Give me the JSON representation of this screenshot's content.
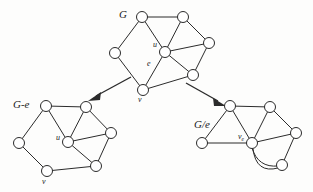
{
  "figure": {
    "background_color": "#fdfdfc",
    "ink_color": "#2b2b2b",
    "node_fill": "#ffffff"
  },
  "labels": {
    "graph_g": "G",
    "graph_g_minus_e": "G-e",
    "graph_g_slash_e": "G/e",
    "vertex_u": "u",
    "edge_e": "e",
    "vertex_v": "v",
    "vertex_u_left": "u",
    "vertex_v_left": "v",
    "vertex_ve_base": "v",
    "vertex_ve_sub": "e"
  },
  "graphs": [
    {
      "name": "G",
      "label": "G",
      "label_pos": [
        119,
        18
      ],
      "nodes": [
        {
          "id": "a",
          "cx": 142,
          "cy": 17,
          "r": 5.5,
          "label": ""
        },
        {
          "id": "b",
          "cx": 183,
          "cy": 17,
          "r": 5.5,
          "label": ""
        },
        {
          "id": "c",
          "cx": 115,
          "cy": 53,
          "r": 5.5,
          "label": ""
        },
        {
          "id": "u",
          "cx": 165,
          "cy": 52,
          "r": 5.5,
          "label": "u"
        },
        {
          "id": "d",
          "cx": 209,
          "cy": 43,
          "r": 5.5,
          "label": ""
        },
        {
          "id": "f",
          "cx": 193,
          "cy": 75,
          "r": 5.5,
          "label": ""
        },
        {
          "id": "v",
          "cx": 143,
          "cy": 90,
          "r": 5.5,
          "label": "v"
        }
      ],
      "edges": [
        {
          "from": "a",
          "to": "b",
          "kind": "straight"
        },
        {
          "from": "a",
          "to": "c",
          "kind": "straight"
        },
        {
          "from": "a",
          "to": "u",
          "kind": "straight"
        },
        {
          "from": "b",
          "to": "u",
          "kind": "straight"
        },
        {
          "from": "b",
          "to": "d",
          "kind": "straight"
        },
        {
          "from": "c",
          "to": "v",
          "kind": "straight"
        },
        {
          "from": "u",
          "to": "d",
          "kind": "straight"
        },
        {
          "from": "u",
          "to": "f",
          "kind": "straight"
        },
        {
          "from": "u",
          "to": "v",
          "kind": "straight",
          "is_e": true
        },
        {
          "from": "d",
          "to": "f",
          "kind": "straight"
        },
        {
          "from": "f",
          "to": "v",
          "kind": "straight"
        }
      ]
    },
    {
      "name": "G-e",
      "label": "G-e",
      "label_pos": [
        16,
        104
      ],
      "nodes": [
        {
          "id": "a",
          "cx": 46,
          "cy": 106,
          "r": 5.5,
          "label": ""
        },
        {
          "id": "b",
          "cx": 86,
          "cy": 107,
          "r": 5.5,
          "label": ""
        },
        {
          "id": "c",
          "cx": 19,
          "cy": 143,
          "r": 5.5,
          "label": ""
        },
        {
          "id": "u",
          "cx": 68,
          "cy": 142,
          "r": 5.5,
          "label": "u"
        },
        {
          "id": "d",
          "cx": 111,
          "cy": 133,
          "r": 5.5,
          "label": ""
        },
        {
          "id": "f",
          "cx": 96,
          "cy": 166,
          "r": 5.5,
          "label": ""
        },
        {
          "id": "v",
          "cx": 47,
          "cy": 171,
          "r": 5.5,
          "label": "v"
        }
      ],
      "edges": [
        {
          "from": "a",
          "to": "b",
          "kind": "straight"
        },
        {
          "from": "a",
          "to": "c",
          "kind": "straight"
        },
        {
          "from": "a",
          "to": "u",
          "kind": "straight"
        },
        {
          "from": "b",
          "to": "u",
          "kind": "straight"
        },
        {
          "from": "b",
          "to": "d",
          "kind": "straight"
        },
        {
          "from": "c",
          "to": "v",
          "kind": "straight"
        },
        {
          "from": "u",
          "to": "d",
          "kind": "straight"
        },
        {
          "from": "u",
          "to": "f",
          "kind": "straight"
        },
        {
          "from": "d",
          "to": "f",
          "kind": "straight"
        },
        {
          "from": "f",
          "to": "v",
          "kind": "straight"
        }
      ]
    },
    {
      "name": "G/e",
      "label": "G/e",
      "label_pos": [
        194,
        125
      ],
      "nodes": [
        {
          "id": "a",
          "cx": 230,
          "cy": 106,
          "r": 5.5,
          "label": ""
        },
        {
          "id": "b",
          "cx": 270,
          "cy": 107,
          "r": 5.5,
          "label": ""
        },
        {
          "id": "c",
          "cx": 202,
          "cy": 143,
          "r": 5.5,
          "label": ""
        },
        {
          "id": "ve",
          "cx": 252,
          "cy": 143,
          "r": 5.5,
          "label": "v_e"
        },
        {
          "id": "d",
          "cx": 296,
          "cy": 133,
          "r": 5.5,
          "label": ""
        },
        {
          "id": "f",
          "cx": 282,
          "cy": 165,
          "r": 5.5,
          "label": ""
        }
      ],
      "edges": [
        {
          "from": "a",
          "to": "b",
          "kind": "straight"
        },
        {
          "from": "a",
          "to": "c",
          "kind": "straight"
        },
        {
          "from": "a",
          "to": "ve",
          "kind": "straight"
        },
        {
          "from": "b",
          "to": "ve",
          "kind": "straight"
        },
        {
          "from": "b",
          "to": "d",
          "kind": "straight"
        },
        {
          "from": "c",
          "to": "ve",
          "kind": "straight"
        },
        {
          "from": "ve",
          "to": "d",
          "kind": "straight"
        },
        {
          "from": "ve",
          "to": "f",
          "kind": "curve-up"
        },
        {
          "from": "ve",
          "to": "f",
          "kind": "curve-down"
        },
        {
          "from": "d",
          "to": "f",
          "kind": "straight"
        }
      ]
    }
  ],
  "arrows": [
    {
      "name": "arrow-to-g-minus-e",
      "x1": 131,
      "y1": 77,
      "x2": 91,
      "y2": 99
    },
    {
      "name": "arrow-to-g-slash-e",
      "x1": 186,
      "y1": 83,
      "x2": 223,
      "y2": 104
    }
  ]
}
